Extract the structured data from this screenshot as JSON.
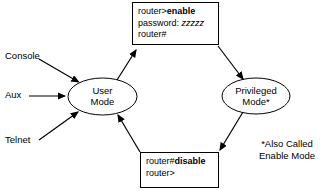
{
  "diagram": {
    "background_color": "#ffffff",
    "line_color": "#000000"
  },
  "nodes": {
    "user_mode": {
      "label_line1": "User",
      "label_line2": "Mode"
    },
    "privileged_mode": {
      "label_line1": "Privileged",
      "label_line2": "Mode*"
    }
  },
  "boxes": {
    "enable_box": {
      "line1_prefix": "router>",
      "line1_command": "enable",
      "line2_prefix": "password: ",
      "line2_value": "zzzzz",
      "line3": "router#"
    },
    "disable_box": {
      "line1_prefix": "router#",
      "line1_command": "disable",
      "line2": "router>"
    }
  },
  "access_methods": [
    {
      "label": "Console"
    },
    {
      "label": "Aux"
    },
    {
      "label": "Telnet"
    }
  ],
  "footnote": {
    "line1": "*Also Called",
    "line2": "Enable Mode"
  }
}
